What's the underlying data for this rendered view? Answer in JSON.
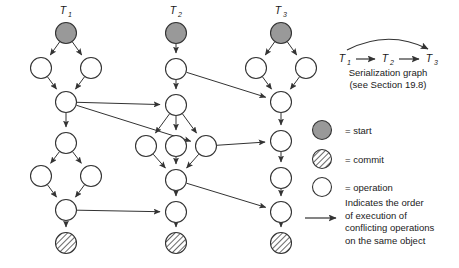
{
  "figure": {
    "transactions": [
      {
        "id": "T1",
        "label": "T",
        "sub": "1",
        "label_x": 66,
        "label_y": 14
      },
      {
        "id": "T2",
        "label": "T",
        "sub": "2",
        "label_x": 176,
        "label_y": 14
      },
      {
        "id": "T3",
        "label": "T",
        "sub": "3",
        "label_x": 281,
        "label_y": 14
      }
    ],
    "node_radius": 10.5,
    "nodes": [
      {
        "id": "t1-start",
        "txn": "T1",
        "kind": "start",
        "cx": 66,
        "cy": 33
      },
      {
        "id": "t1-a",
        "txn": "T1",
        "kind": "operation",
        "cx": 41,
        "cy": 68
      },
      {
        "id": "t1-b",
        "txn": "T1",
        "kind": "operation",
        "cx": 91,
        "cy": 68
      },
      {
        "id": "t1-c",
        "txn": "T1",
        "kind": "operation",
        "cx": 66,
        "cy": 102
      },
      {
        "id": "t1-d",
        "txn": "T1",
        "kind": "operation",
        "cx": 66,
        "cy": 143
      },
      {
        "id": "t1-e",
        "txn": "T1",
        "kind": "operation",
        "cx": 41,
        "cy": 176
      },
      {
        "id": "t1-f",
        "txn": "T1",
        "kind": "operation",
        "cx": 91,
        "cy": 176
      },
      {
        "id": "t1-g",
        "txn": "T1",
        "kind": "operation",
        "cx": 66,
        "cy": 210
      },
      {
        "id": "t1-commit",
        "txn": "T1",
        "kind": "commit",
        "cx": 66,
        "cy": 243
      },
      {
        "id": "t2-start",
        "txn": "T2",
        "kind": "start",
        "cx": 176,
        "cy": 33
      },
      {
        "id": "t2-a",
        "txn": "T2",
        "kind": "operation",
        "cx": 176,
        "cy": 69
      },
      {
        "id": "t2-b",
        "txn": "T2",
        "kind": "operation",
        "cx": 176,
        "cy": 105
      },
      {
        "id": "t2-c",
        "txn": "T2",
        "kind": "operation",
        "cx": 146,
        "cy": 146
      },
      {
        "id": "t2-d",
        "txn": "T2",
        "kind": "operation",
        "cx": 176,
        "cy": 146
      },
      {
        "id": "t2-e",
        "txn": "T2",
        "kind": "operation",
        "cx": 206,
        "cy": 146
      },
      {
        "id": "t2-f",
        "txn": "T2",
        "kind": "operation",
        "cx": 176,
        "cy": 180
      },
      {
        "id": "t2-g",
        "txn": "T2",
        "kind": "operation",
        "cx": 176,
        "cy": 212
      },
      {
        "id": "t2-commit",
        "txn": "T2",
        "kind": "commit",
        "cx": 176,
        "cy": 243
      },
      {
        "id": "t3-start",
        "txn": "T3",
        "kind": "start",
        "cx": 281,
        "cy": 33
      },
      {
        "id": "t3-a",
        "txn": "T3",
        "kind": "operation",
        "cx": 256,
        "cy": 68
      },
      {
        "id": "t3-b",
        "txn": "T3",
        "kind": "operation",
        "cx": 306,
        "cy": 68
      },
      {
        "id": "t3-c",
        "txn": "T3",
        "kind": "operation",
        "cx": 281,
        "cy": 102
      },
      {
        "id": "t3-d",
        "txn": "T3",
        "kind": "operation",
        "cx": 281,
        "cy": 141
      },
      {
        "id": "t3-e",
        "txn": "T3",
        "kind": "operation",
        "cx": 281,
        "cy": 178
      },
      {
        "id": "t3-f",
        "txn": "T3",
        "kind": "operation",
        "cx": 281,
        "cy": 212
      },
      {
        "id": "t3-commit",
        "txn": "T3",
        "kind": "commit",
        "cx": 281,
        "cy": 243
      }
    ],
    "intra_edges": [
      [
        "t1-start",
        "t1-a"
      ],
      [
        "t1-start",
        "t1-b"
      ],
      [
        "t1-a",
        "t1-c"
      ],
      [
        "t1-b",
        "t1-c"
      ],
      [
        "t1-c",
        "t1-d"
      ],
      [
        "t1-d",
        "t1-e"
      ],
      [
        "t1-d",
        "t1-f"
      ],
      [
        "t1-e",
        "t1-g"
      ],
      [
        "t1-f",
        "t1-g"
      ],
      [
        "t1-g",
        "t1-commit"
      ],
      [
        "t2-start",
        "t2-a"
      ],
      [
        "t2-a",
        "t2-b"
      ],
      [
        "t2-b",
        "t2-c"
      ],
      [
        "t2-b",
        "t2-d"
      ],
      [
        "t2-b",
        "t2-e"
      ],
      [
        "t2-c",
        "t2-f"
      ],
      [
        "t2-d",
        "t2-f"
      ],
      [
        "t2-e",
        "t2-f"
      ],
      [
        "t2-f",
        "t2-g"
      ],
      [
        "t2-g",
        "t2-commit"
      ],
      [
        "t3-start",
        "t3-a"
      ],
      [
        "t3-start",
        "t3-b"
      ],
      [
        "t3-a",
        "t3-c"
      ],
      [
        "t3-b",
        "t3-c"
      ],
      [
        "t3-c",
        "t3-d"
      ],
      [
        "t3-d",
        "t3-e"
      ],
      [
        "t3-e",
        "t3-f"
      ],
      [
        "t3-f",
        "t3-commit"
      ]
    ],
    "conflict_edges": [
      [
        "t1-c",
        "t2-b"
      ],
      [
        "t1-c",
        "t2-e"
      ],
      [
        "t1-g",
        "t2-g"
      ],
      [
        "t2-a",
        "t3-c"
      ],
      [
        "t2-e",
        "t3-d"
      ],
      [
        "t2-f",
        "t3-f"
      ]
    ],
    "serialization_graph": {
      "caption_line1": "Serialization graph",
      "caption_line2": "(see Section 19.8)",
      "nodes": [
        {
          "label": "T",
          "sub": "1",
          "x": 345,
          "y": 62
        },
        {
          "label": "T",
          "sub": "2",
          "x": 388,
          "y": 62
        },
        {
          "label": "T",
          "sub": "3",
          "x": 432,
          "y": 62
        }
      ],
      "caption1_x": 388,
      "caption1_y": 76,
      "caption2_x": 388,
      "caption2_y": 88
    },
    "legend": {
      "items": [
        {
          "key": "start",
          "swatch": "start-circle",
          "text": "= start",
          "cy": 130
        },
        {
          "key": "commit",
          "swatch": "commit-circle",
          "text": "= commit",
          "cy": 159
        },
        {
          "key": "operation",
          "swatch": "operation-circle",
          "text": "= operation",
          "cy": 187
        }
      ],
      "arrow_note_lines": [
        "Indicates the order",
        "of execution of",
        "conflicting operations",
        "on the same object"
      ],
      "swatch_cx": 322,
      "text_x": 345,
      "arrow_y": 218,
      "note_x": 345,
      "note_y": 206
    },
    "colors": {
      "start_fill": "#999999",
      "commit_fill": "#ffffff",
      "commit_hatch": "#444444",
      "operation_fill": "#ffffff",
      "stroke": "#333333",
      "text": "#1a1a1a",
      "background": "#ffffff"
    }
  }
}
